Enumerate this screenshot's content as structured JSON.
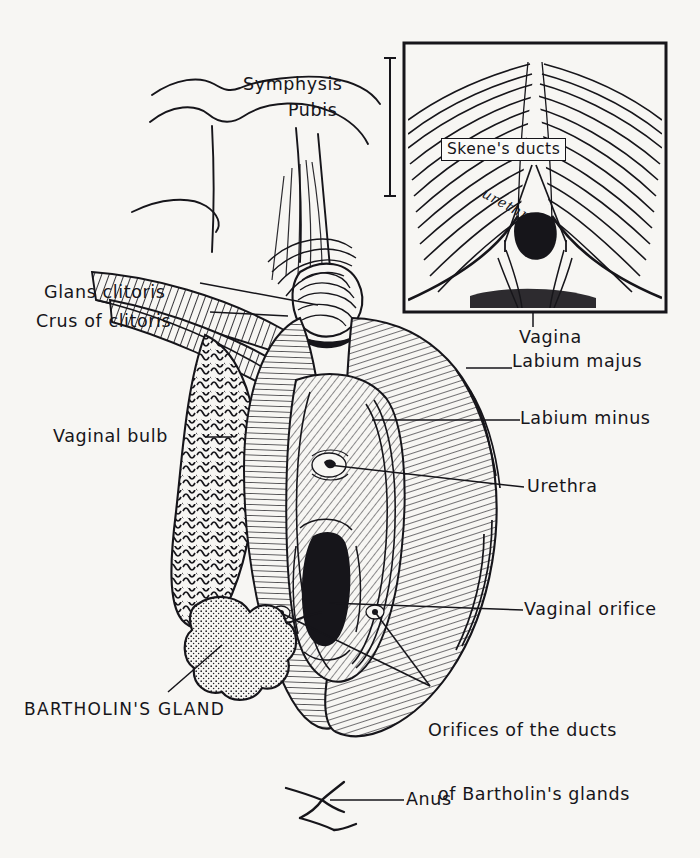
{
  "figure": {
    "kind": "anatomical-line-drawing",
    "background_color": "#f7f6f3",
    "ink_color": "#16151a"
  },
  "inset": {
    "name": "vestibule-closeup",
    "box": {
      "x": 404,
      "y": 43,
      "width": 262,
      "height": 269
    },
    "labels": {
      "skenes_ducts": "Skene's ducts",
      "urethra": "urethra"
    }
  },
  "labels": {
    "symphysis_pubis_line1": "Symphysis",
    "symphysis_pubis_line2": "Pubis",
    "glans_clitoris": "Glans clitoris",
    "crus_of_clitoris": "Crus of clitoris",
    "vaginal_bulb": "Vaginal bulb",
    "vagina": "Vagina",
    "labium_majus": "Labium majus",
    "labium_minus": "Labium minus",
    "urethra": "Urethra",
    "vaginal_orifice": "Vaginal orifice",
    "bartholin_ducts_line1": "Orifices of the ducts",
    "bartholin_ducts_line2": "of Bartholin's glands",
    "bartholins_gland": "BARTHOLIN'S GLAND",
    "anus": "Anus"
  },
  "structures": [
    {
      "name": "symphysis-pubis",
      "label_key": "symphysis_pubis_line1"
    },
    {
      "name": "glans-clitoris",
      "label_key": "glans_clitoris"
    },
    {
      "name": "crus-of-clitoris",
      "label_key": "crus_of_clitoris"
    },
    {
      "name": "vaginal-bulb",
      "label_key": "vaginal_bulb"
    },
    {
      "name": "labium-majus",
      "label_key": "labium_majus"
    },
    {
      "name": "labium-minus",
      "label_key": "labium_minus"
    },
    {
      "name": "urethral-orifice",
      "label_key": "urethra"
    },
    {
      "name": "vaginal-orifice",
      "label_key": "vaginal_orifice"
    },
    {
      "name": "bartholins-duct-orifices",
      "label_key": "bartholin_ducts_line1"
    },
    {
      "name": "bartholins-gland",
      "label_key": "bartholins_gland"
    },
    {
      "name": "anus",
      "label_key": "anus"
    }
  ]
}
